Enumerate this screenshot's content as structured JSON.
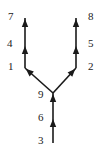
{
  "diagram": {
    "type": "directed tree",
    "colors": {
      "line": "#1a1a1a",
      "text": "#222222",
      "background": "#ffffff"
    },
    "nodes": [
      {
        "id": "3",
        "label": "3",
        "x": 53,
        "y": 143,
        "label_x": 38,
        "label_y": 144
      },
      {
        "id": "6",
        "label": "6",
        "x": 53,
        "y": 118,
        "label_x": 38,
        "label_y": 121
      },
      {
        "id": "9",
        "label": "9",
        "x": 53,
        "y": 93,
        "label_x": 38,
        "label_y": 98
      },
      {
        "id": "1",
        "label": "1",
        "x": 25,
        "y": 68,
        "label_x": 8,
        "label_y": 70
      },
      {
        "id": "2",
        "label": "2",
        "x": 76,
        "y": 68,
        "label_x": 88,
        "label_y": 70
      },
      {
        "id": "4",
        "label": "4",
        "x": 25,
        "y": 45,
        "label_x": 7,
        "label_y": 47
      },
      {
        "id": "5",
        "label": "5",
        "x": 76,
        "y": 45,
        "label_x": 88,
        "label_y": 47
      },
      {
        "id": "7",
        "label": "7",
        "x": 25,
        "y": 18,
        "label_x": 8,
        "label_y": 20
      },
      {
        "id": "8",
        "label": "8",
        "x": 76,
        "y": 18,
        "label_x": 88,
        "label_y": 20
      }
    ],
    "edges": [
      {
        "from": "3",
        "to": "6"
      },
      {
        "from": "6",
        "to": "9"
      },
      {
        "from": "9",
        "to": "1"
      },
      {
        "from": "9",
        "to": "2"
      },
      {
        "from": "1",
        "to": "4"
      },
      {
        "from": "4",
        "to": "7"
      },
      {
        "from": "2",
        "to": "5"
      },
      {
        "from": "5",
        "to": "8"
      }
    ]
  }
}
